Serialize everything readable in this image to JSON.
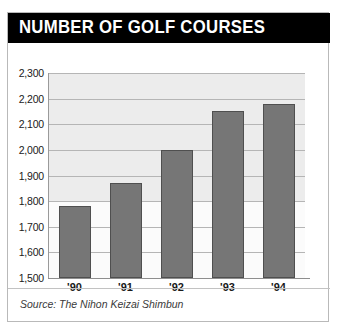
{
  "title": "NUMBER OF GOLF COURSES",
  "source": {
    "label": "Source:",
    "name": "The Nihon Keizai Shimbun"
  },
  "colors": {
    "banner_background": "#000000",
    "banner_text": "#ffffff",
    "bar_fill": "#767676",
    "bar_stroke": "#4f4f4f",
    "plot_background": "#ececec",
    "gridline": "#b5b5b5",
    "card_border": "#b9b9b9"
  },
  "chart_data": {
    "type": "bar",
    "title": "NUMBER OF GOLF COURSES",
    "xlabel": "",
    "ylabel": "",
    "categories": [
      "'90",
      "'91",
      "'92",
      "'93",
      "'94"
    ],
    "values": [
      1780,
      1870,
      2000,
      2150,
      2180
    ],
    "ylim": [
      1500,
      2300
    ],
    "ytick_values": [
      2300,
      2200,
      2100,
      2000,
      1900,
      1800,
      1700,
      1600,
      1500
    ],
    "ytick_labels": [
      "2,300",
      "2,200",
      "2,100",
      "2,000",
      "1,900",
      "1,800",
      "1,700",
      "1,600",
      "1,500"
    ],
    "grid": true,
    "legend": false,
    "series": [
      {
        "name": "Number of golf courses",
        "values": [
          1780,
          1870,
          2000,
          2150,
          2180
        ]
      }
    ]
  }
}
